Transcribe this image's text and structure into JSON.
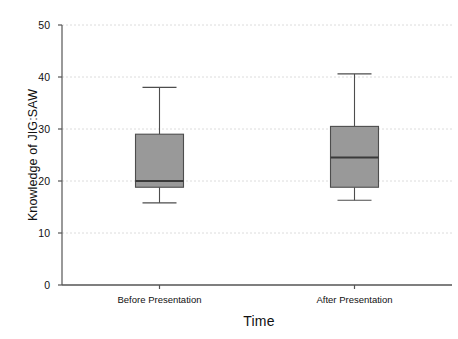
{
  "chart_data": {
    "type": "box",
    "title": "",
    "xlabel": "Time",
    "ylabel": "Knowledge of JIG:SAW",
    "categories": [
      "Before Presentation",
      "After Presentation"
    ],
    "ylim": [
      0,
      50
    ],
    "yticks": [
      0,
      10,
      20,
      30,
      40,
      50
    ],
    "ytick_labels": [
      "0",
      "10",
      "20",
      "30",
      "40",
      "50"
    ],
    "grid": "horizontal-dashed",
    "legend": "none",
    "box_color": "#999999",
    "line_color": "#4d4d4d",
    "axis_color": "#555555",
    "grid_color": "#dcdcdc",
    "boxes": [
      {
        "label": "Before Presentation",
        "whisker_low": 15.8,
        "q1": 18.8,
        "median": 20.0,
        "q3": 29.0,
        "whisker_high": 38.0
      },
      {
        "label": "After Presentation",
        "whisker_low": 16.3,
        "q1": 18.8,
        "median": 24.5,
        "q3": 30.5,
        "whisker_high": 40.6
      }
    ]
  }
}
